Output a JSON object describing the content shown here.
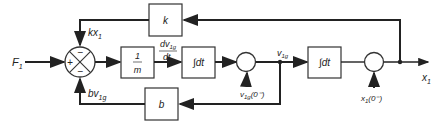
{
  "diagram": {
    "title": "",
    "type": "block-diagram",
    "input": {
      "label": "F",
      "sub": "1"
    },
    "output": {
      "label": "x",
      "sub": "1"
    },
    "summing_junction": {
      "signs": {
        "left": "+",
        "top": "−",
        "bottom": "−"
      }
    },
    "blocks": [
      {
        "id": "k",
        "label": "k"
      },
      {
        "id": "inv_m",
        "num": "1",
        "den": "m"
      },
      {
        "id": "int1",
        "label": "∫dt"
      },
      {
        "id": "int2",
        "label": "∫dt"
      },
      {
        "id": "b",
        "label": "b"
      }
    ],
    "signals": {
      "kx1": {
        "main": "kx",
        "sub": "1"
      },
      "bv1g": {
        "main": "bv",
        "sub": "1g"
      },
      "dv1g_dt": {
        "num": "dv",
        "num_sub": "1g",
        "den": "dt"
      },
      "v1g": {
        "main": "v",
        "sub": "1g"
      },
      "v1g_init": {
        "main": "v",
        "sub": "1g",
        "rest": "(0⁻)"
      },
      "x1_init": {
        "main": "x",
        "sub": "1",
        "rest": "(0⁻)"
      }
    }
  }
}
